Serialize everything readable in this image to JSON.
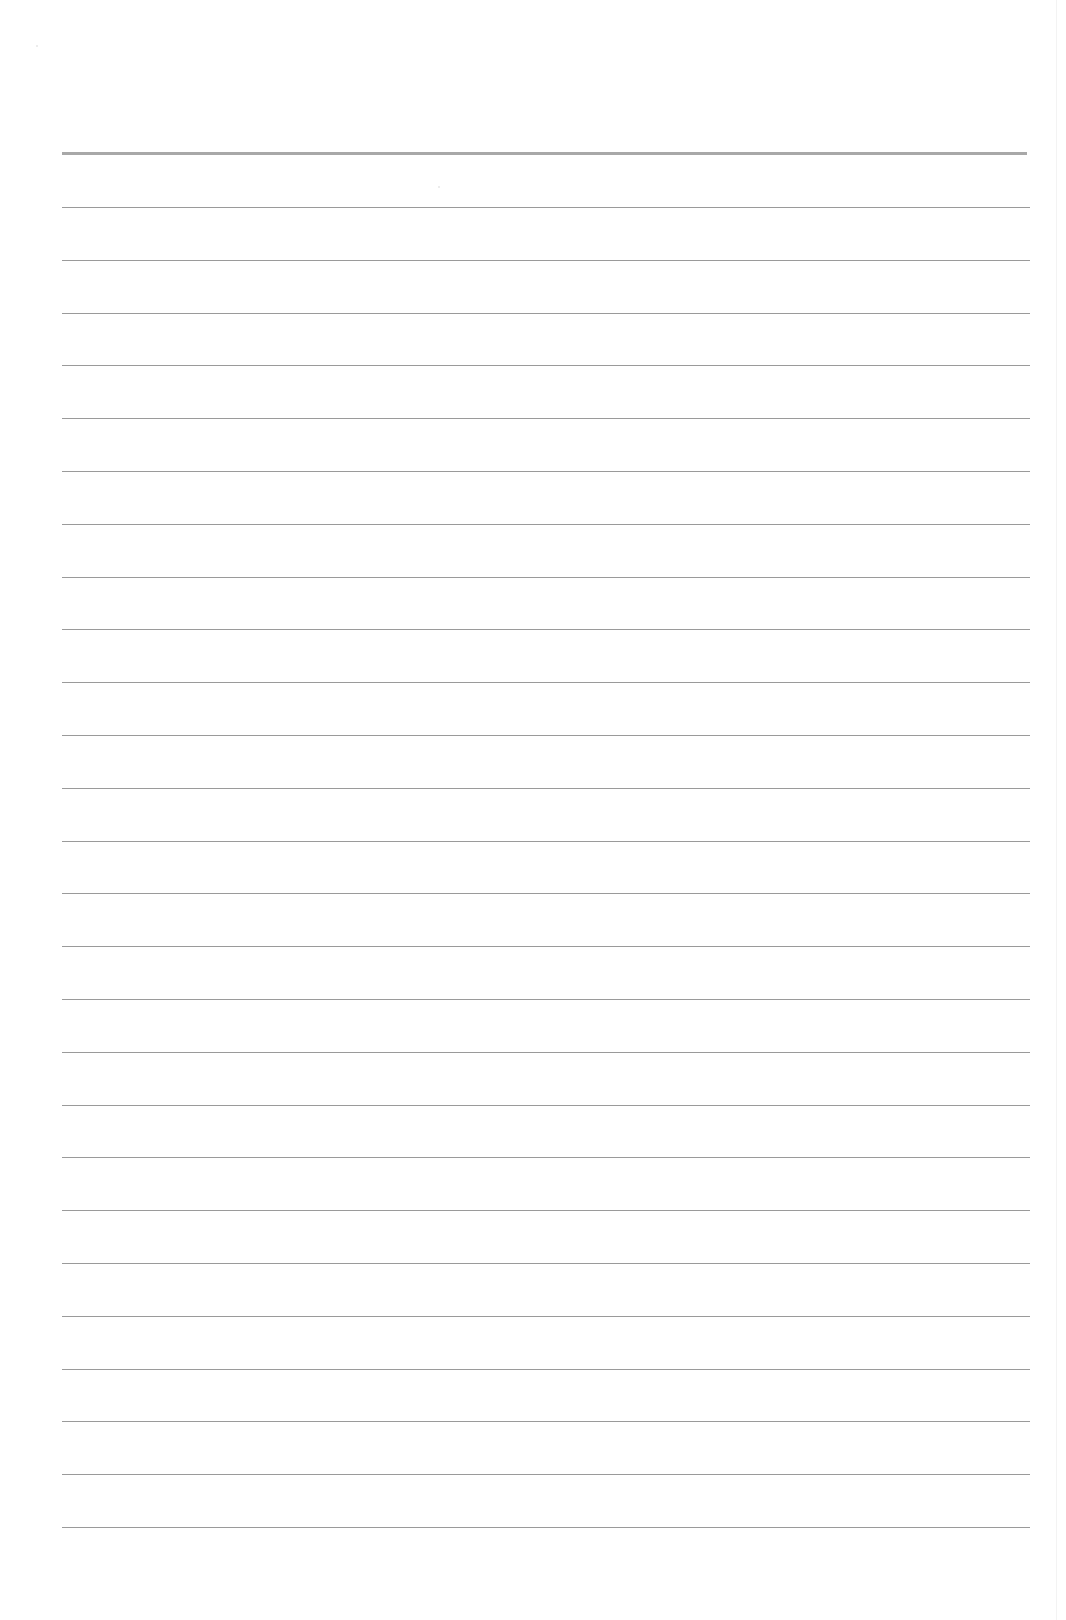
{
  "document": {
    "type": "lined-paper",
    "background_color": "#ffffff",
    "rule_color": "#9a9a9a",
    "header_rule_color": "#a8a8a8",
    "header_rule": {
      "y": 152,
      "x_start": 62,
      "x_end": 1027,
      "thickness": 3
    },
    "rules": {
      "count": 26,
      "first_y": 207,
      "spacing": 52.8,
      "x_start": 62,
      "x_end": 1030,
      "thickness": 1
    },
    "text_content": []
  }
}
